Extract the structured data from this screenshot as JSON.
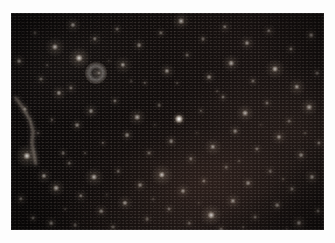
{
  "page": {
    "background_color": "#fdfdfd",
    "width": 335,
    "height": 243,
    "caption": ""
  },
  "plate": {
    "name": "star-field-image",
    "description": "Dense astronomical star field, near-infrared exposure",
    "x": 11,
    "y": 13,
    "width": 313,
    "height": 217,
    "background_color": "#0b0909",
    "sky_tint_color": "#171110",
    "star_color": "#ffffff",
    "warm_halo_color": "#e8d2b4"
  },
  "features": {
    "filament_label": "linear bright filament / trail",
    "extended_object_label": "resolved ring-like extended source",
    "point_source_label": "unresolved point source"
  },
  "chart_data": {
    "type": "scatter",
    "xlabel": "x (px)",
    "ylabel": "y (px)",
    "xlim": [
      0,
      313
    ],
    "ylim": [
      0,
      217
    ],
    "grid": false,
    "legend": "none",
    "note": "x,y are plate pixel coordinates; r = apparent radius px; b = relative brightness 0-1; h = warm halo radius px",
    "stars": [
      {
        "x": 8,
        "y": 48,
        "r": 2.4,
        "b": 0.42,
        "h": 7
      },
      {
        "x": 14,
        "y": 96,
        "r": 2.0,
        "b": 0.34,
        "h": 6
      },
      {
        "x": 16,
        "y": 143,
        "r": 3.6,
        "b": 0.8,
        "h": 12
      },
      {
        "x": 10,
        "y": 186,
        "r": 2.2,
        "b": 0.4,
        "h": 7
      },
      {
        "x": 24,
        "y": 20,
        "r": 1.6,
        "b": 0.26,
        "h": 5
      },
      {
        "x": 30,
        "y": 66,
        "r": 2.0,
        "b": 0.33,
        "h": 6
      },
      {
        "x": 27,
        "y": 120,
        "r": 1.5,
        "b": 0.22,
        "h": 5
      },
      {
        "x": 33,
        "y": 163,
        "r": 2.6,
        "b": 0.48,
        "h": 8
      },
      {
        "x": 22,
        "y": 205,
        "r": 2.0,
        "b": 0.35,
        "h": 6
      },
      {
        "x": 44,
        "y": 34,
        "r": 3.1,
        "b": 0.62,
        "h": 10
      },
      {
        "x": 48,
        "y": 80,
        "r": 2.6,
        "b": 0.47,
        "h": 8
      },
      {
        "x": 41,
        "y": 107,
        "r": 1.7,
        "b": 0.27,
        "h": 5
      },
      {
        "x": 52,
        "y": 140,
        "r": 1.9,
        "b": 0.31,
        "h": 6
      },
      {
        "x": 45,
        "y": 175,
        "r": 2.9,
        "b": 0.55,
        "h": 9
      },
      {
        "x": 40,
        "y": 210,
        "r": 2.3,
        "b": 0.4,
        "h": 7
      },
      {
        "x": 62,
        "y": 12,
        "r": 2.6,
        "b": 0.5,
        "h": 8
      },
      {
        "x": 68,
        "y": 45,
        "r": 3.4,
        "b": 0.72,
        "h": 11
      },
      {
        "x": 60,
        "y": 75,
        "r": 2.1,
        "b": 0.35,
        "h": 7
      },
      {
        "x": 66,
        "y": 112,
        "r": 2.4,
        "b": 0.42,
        "h": 7
      },
      {
        "x": 58,
        "y": 150,
        "r": 1.8,
        "b": 0.28,
        "h": 6
      },
      {
        "x": 70,
        "y": 183,
        "r": 2.2,
        "b": 0.38,
        "h": 7
      },
      {
        "x": 64,
        "y": 212,
        "r": 1.9,
        "b": 0.3,
        "h": 6
      },
      {
        "x": 84,
        "y": 26,
        "r": 2.2,
        "b": 0.38,
        "h": 7
      },
      {
        "x": 88,
        "y": 60,
        "r": 2.0,
        "b": 0.33,
        "h": 6
      },
      {
        "x": 80,
        "y": 98,
        "r": 2.5,
        "b": 0.45,
        "h": 8
      },
      {
        "x": 92,
        "y": 130,
        "r": 1.7,
        "b": 0.26,
        "h": 5
      },
      {
        "x": 83,
        "y": 164,
        "r": 3.0,
        "b": 0.58,
        "h": 10
      },
      {
        "x": 90,
        "y": 198,
        "r": 2.3,
        "b": 0.4,
        "h": 7
      },
      {
        "x": 106,
        "y": 16,
        "r": 1.9,
        "b": 0.3,
        "h": 6
      },
      {
        "x": 112,
        "y": 52,
        "r": 2.7,
        "b": 0.5,
        "h": 9
      },
      {
        "x": 104,
        "y": 88,
        "r": 2.1,
        "b": 0.34,
        "h": 6
      },
      {
        "x": 116,
        "y": 122,
        "r": 2.4,
        "b": 0.43,
        "h": 7
      },
      {
        "x": 107,
        "y": 158,
        "r": 1.8,
        "b": 0.28,
        "h": 6
      },
      {
        "x": 114,
        "y": 190,
        "r": 2.6,
        "b": 0.48,
        "h": 8
      },
      {
        "x": 102,
        "y": 214,
        "r": 2.0,
        "b": 0.32,
        "h": 6
      },
      {
        "x": 128,
        "y": 32,
        "r": 2.3,
        "b": 0.4,
        "h": 7
      },
      {
        "x": 134,
        "y": 70,
        "r": 1.7,
        "b": 0.25,
        "h": 5
      },
      {
        "x": 126,
        "y": 104,
        "r": 2.8,
        "b": 0.53,
        "h": 9
      },
      {
        "x": 138,
        "y": 140,
        "r": 2.0,
        "b": 0.33,
        "h": 6
      },
      {
        "x": 129,
        "y": 172,
        "r": 2.4,
        "b": 0.42,
        "h": 7
      },
      {
        "x": 136,
        "y": 206,
        "r": 1.9,
        "b": 0.3,
        "h": 6
      },
      {
        "x": 150,
        "y": 20,
        "r": 2.1,
        "b": 0.35,
        "h": 6
      },
      {
        "x": 156,
        "y": 58,
        "r": 2.6,
        "b": 0.47,
        "h": 8
      },
      {
        "x": 148,
        "y": 92,
        "r": 1.8,
        "b": 0.27,
        "h": 5
      },
      {
        "x": 160,
        "y": 128,
        "r": 2.3,
        "b": 0.4,
        "h": 7
      },
      {
        "x": 151,
        "y": 162,
        "r": 3.2,
        "b": 0.65,
        "h": 11
      },
      {
        "x": 158,
        "y": 196,
        "r": 2.0,
        "b": 0.33,
        "h": 6
      },
      {
        "x": 170,
        "y": 8,
        "r": 2.9,
        "b": 0.56,
        "h": 9
      },
      {
        "x": 176,
        "y": 42,
        "r": 1.9,
        "b": 0.3,
        "h": 6
      },
      {
        "x": 168,
        "y": 106,
        "r": 4.0,
        "b": 0.96,
        "h": 7
      },
      {
        "x": 180,
        "y": 146,
        "r": 2.2,
        "b": 0.37,
        "h": 7
      },
      {
        "x": 172,
        "y": 178,
        "r": 2.5,
        "b": 0.45,
        "h": 8
      },
      {
        "x": 178,
        "y": 210,
        "r": 1.8,
        "b": 0.28,
        "h": 6
      },
      {
        "x": 192,
        "y": 26,
        "r": 2.0,
        "b": 0.33,
        "h": 6
      },
      {
        "x": 198,
        "y": 64,
        "r": 2.4,
        "b": 0.43,
        "h": 7
      },
      {
        "x": 190,
        "y": 98,
        "r": 1.7,
        "b": 0.26,
        "h": 5
      },
      {
        "x": 202,
        "y": 134,
        "r": 2.7,
        "b": 0.5,
        "h": 9
      },
      {
        "x": 193,
        "y": 168,
        "r": 2.1,
        "b": 0.35,
        "h": 6
      },
      {
        "x": 200,
        "y": 202,
        "r": 3.3,
        "b": 0.68,
        "h": 11
      },
      {
        "x": 214,
        "y": 14,
        "r": 2.2,
        "b": 0.38,
        "h": 7
      },
      {
        "x": 220,
        "y": 50,
        "r": 2.8,
        "b": 0.53,
        "h": 9
      },
      {
        "x": 212,
        "y": 84,
        "r": 2.0,
        "b": 0.32,
        "h": 6
      },
      {
        "x": 224,
        "y": 118,
        "r": 2.3,
        "b": 0.4,
        "h": 7
      },
      {
        "x": 215,
        "y": 154,
        "r": 1.8,
        "b": 0.28,
        "h": 6
      },
      {
        "x": 222,
        "y": 188,
        "r": 2.6,
        "b": 0.47,
        "h": 8
      },
      {
        "x": 210,
        "y": 216,
        "r": 1.9,
        "b": 0.3,
        "h": 6
      },
      {
        "x": 236,
        "y": 30,
        "r": 2.5,
        "b": 0.45,
        "h": 8
      },
      {
        "x": 242,
        "y": 68,
        "r": 2.0,
        "b": 0.33,
        "h": 6
      },
      {
        "x": 234,
        "y": 100,
        "r": 2.9,
        "b": 0.56,
        "h": 9
      },
      {
        "x": 246,
        "y": 136,
        "r": 2.1,
        "b": 0.35,
        "h": 6
      },
      {
        "x": 237,
        "y": 170,
        "r": 2.4,
        "b": 0.42,
        "h": 7
      },
      {
        "x": 244,
        "y": 204,
        "r": 1.9,
        "b": 0.3,
        "h": 6
      },
      {
        "x": 258,
        "y": 18,
        "r": 2.2,
        "b": 0.37,
        "h": 7
      },
      {
        "x": 264,
        "y": 56,
        "r": 3.0,
        "b": 0.6,
        "h": 10
      },
      {
        "x": 256,
        "y": 90,
        "r": 2.0,
        "b": 0.32,
        "h": 6
      },
      {
        "x": 268,
        "y": 124,
        "r": 2.5,
        "b": 0.45,
        "h": 8
      },
      {
        "x": 259,
        "y": 158,
        "r": 1.8,
        "b": 0.28,
        "h": 6
      },
      {
        "x": 266,
        "y": 192,
        "r": 2.3,
        "b": 0.4,
        "h": 7
      },
      {
        "x": 280,
        "y": 36,
        "r": 2.1,
        "b": 0.35,
        "h": 6
      },
      {
        "x": 286,
        "y": 74,
        "r": 2.7,
        "b": 0.5,
        "h": 9
      },
      {
        "x": 278,
        "y": 108,
        "r": 1.9,
        "b": 0.3,
        "h": 6
      },
      {
        "x": 290,
        "y": 142,
        "r": 2.4,
        "b": 0.42,
        "h": 7
      },
      {
        "x": 281,
        "y": 176,
        "r": 2.0,
        "b": 0.33,
        "h": 6
      },
      {
        "x": 288,
        "y": 210,
        "r": 2.6,
        "b": 0.47,
        "h": 8
      },
      {
        "x": 300,
        "y": 22,
        "r": 2.3,
        "b": 0.4,
        "h": 7
      },
      {
        "x": 306,
        "y": 60,
        "r": 1.9,
        "b": 0.3,
        "h": 6
      },
      {
        "x": 298,
        "y": 94,
        "r": 2.8,
        "b": 0.54,
        "h": 9
      },
      {
        "x": 308,
        "y": 130,
        "r": 2.1,
        "b": 0.35,
        "h": 6
      },
      {
        "x": 301,
        "y": 164,
        "r": 2.5,
        "b": 0.45,
        "h": 8
      },
      {
        "x": 307,
        "y": 198,
        "r": 2.0,
        "b": 0.33,
        "h": 6
      },
      {
        "x": 248,
        "y": 255,
        "r": 1.0,
        "b": 0.0,
        "h": 0
      },
      {
        "x": 36,
        "y": 52,
        "r": 1.3,
        "b": 0.18,
        "h": 4
      },
      {
        "x": 74,
        "y": 140,
        "r": 1.4,
        "b": 0.2,
        "h": 4
      },
      {
        "x": 98,
        "y": 48,
        "r": 1.2,
        "b": 0.16,
        "h": 4
      },
      {
        "x": 120,
        "y": 68,
        "r": 1.3,
        "b": 0.18,
        "h": 4
      },
      {
        "x": 144,
        "y": 112,
        "r": 1.2,
        "b": 0.16,
        "h": 4
      },
      {
        "x": 166,
        "y": 70,
        "r": 1.4,
        "b": 0.2,
        "h": 4
      },
      {
        "x": 186,
        "y": 120,
        "r": 1.2,
        "b": 0.16,
        "h": 4
      },
      {
        "x": 206,
        "y": 78,
        "r": 1.3,
        "b": 0.18,
        "h": 4
      },
      {
        "x": 228,
        "y": 148,
        "r": 1.4,
        "b": 0.2,
        "h": 4
      },
      {
        "x": 250,
        "y": 112,
        "r": 1.2,
        "b": 0.16,
        "h": 4
      },
      {
        "x": 272,
        "y": 166,
        "r": 1.3,
        "b": 0.18,
        "h": 4
      },
      {
        "x": 294,
        "y": 120,
        "r": 1.4,
        "b": 0.2,
        "h": 4
      },
      {
        "x": 54,
        "y": 196,
        "r": 1.3,
        "b": 0.18,
        "h": 4
      },
      {
        "x": 96,
        "y": 182,
        "r": 1.2,
        "b": 0.16,
        "h": 4
      },
      {
        "x": 142,
        "y": 186,
        "r": 1.3,
        "b": 0.18,
        "h": 4
      },
      {
        "x": 188,
        "y": 190,
        "r": 1.2,
        "b": 0.16,
        "h": 4
      },
      {
        "x": 232,
        "y": 214,
        "r": 1.3,
        "b": 0.18,
        "h": 4
      },
      {
        "x": 276,
        "y": 216,
        "r": 1.2,
        "b": 0.16,
        "h": 4
      }
    ],
    "extended_objects": [
      {
        "x": 85,
        "y": 60,
        "outer_r": 11,
        "inner_r": 5,
        "b": 0.5,
        "label": "ring-like source"
      }
    ],
    "filament": {
      "path": "M 4 84 L 12 95 L 19 107 L 22 118 L 21 130 L 23 141 L 25 152",
      "color": "#cfc2b4",
      "width": 1.1,
      "b": 0.7
    }
  }
}
